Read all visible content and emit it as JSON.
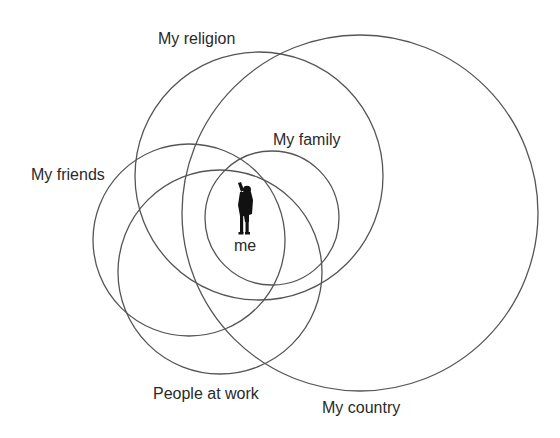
{
  "diagram": {
    "type": "overlapping-circles",
    "stroke_color": "#555555",
    "text_color": "#2a2a2a",
    "center": {
      "label": "me",
      "icon": "person-silhouette-icon"
    },
    "circles": [
      {
        "id": "religion",
        "label": "My religion"
      },
      {
        "id": "family",
        "label": "My family"
      },
      {
        "id": "friends",
        "label": "My friends"
      },
      {
        "id": "work",
        "label": "People at work"
      },
      {
        "id": "country",
        "label": "My country"
      }
    ]
  }
}
